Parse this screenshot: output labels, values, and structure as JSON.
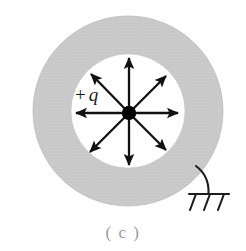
{
  "figure": {
    "caption": "( c )",
    "charge_label_sign": "+",
    "charge_label_symbol": "q",
    "colors": {
      "shell_fill": "#c9c9c9",
      "shell_edge": "#bcbcbc",
      "line": "#111111",
      "charge": "#000000",
      "background": "#ffffff",
      "caption": "#9a9a9a"
    },
    "geometry": {
      "center_x": 128,
      "center_y": 111,
      "outer_radius": 95,
      "inner_radius": 57,
      "charge_dot_x": 129,
      "charge_dot_y": 113,
      "charge_dot_radius": 7,
      "arrow_count": 8,
      "arrow_angles_deg": [
        0,
        45,
        90,
        135,
        180,
        225,
        270,
        315
      ]
    },
    "ground": {
      "name": "earth-ground-symbol",
      "wire_start_x": 196,
      "wire_start_y": 167,
      "wire_end_x": 208,
      "wire_end_y": 191,
      "bar_y": 194,
      "bar_left_x": 189,
      "bar_right_x": 229,
      "hatch_count": 3
    },
    "labels": {
      "shell_name": "conducting-shell",
      "cavity_name": "cavity-region",
      "field_lines_name": "radial-field-lines"
    }
  }
}
